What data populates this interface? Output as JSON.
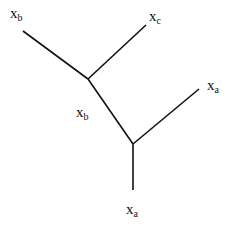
{
  "diagram": {
    "type": "unrooted-tree",
    "colors": {
      "line": "#111111",
      "background": "#ffffff"
    },
    "nodes": [
      {
        "id": "leaf-b-top",
        "x": 23,
        "y": 31
      },
      {
        "id": "leaf-c",
        "x": 146,
        "y": 25
      },
      {
        "id": "internal-1",
        "x": 88,
        "y": 79
      },
      {
        "id": "internal-2",
        "x": 133,
        "y": 144
      },
      {
        "id": "leaf-a-right",
        "x": 199,
        "y": 89
      },
      {
        "id": "leaf-a-bottom",
        "x": 133,
        "y": 190
      }
    ],
    "edges": [
      {
        "from": "leaf-b-top",
        "to": "internal-1",
        "x1": 23,
        "y1": 31,
        "x2": 88,
        "y2": 79
      },
      {
        "from": "internal-1",
        "to": "leaf-c",
        "x1": 88,
        "y1": 79,
        "x2": 146,
        "y2": 25
      },
      {
        "from": "internal-1",
        "to": "internal-2",
        "x1": 88,
        "y1": 79,
        "x2": 133,
        "y2": 144
      },
      {
        "from": "internal-2",
        "to": "leaf-a-right",
        "x1": 133,
        "y1": 144,
        "x2": 199,
        "y2": 89
      },
      {
        "from": "internal-2",
        "to": "leaf-a-bottom",
        "x1": 133,
        "y1": 144,
        "x2": 133,
        "y2": 190
      }
    ],
    "labels": [
      {
        "name": "label-xb-top",
        "base": "x",
        "sub": "b",
        "left": 10,
        "top": 6
      },
      {
        "name": "label-xc",
        "base": "x",
        "sub": "c",
        "left": 149,
        "top": 9
      },
      {
        "name": "label-xa-right",
        "base": "x",
        "sub": "a",
        "left": 207,
        "top": 78
      },
      {
        "name": "label-xb-middle",
        "base": "x",
        "sub": "b",
        "left": 76,
        "top": 105
      },
      {
        "name": "label-xa-bottom",
        "base": "x",
        "sub": "a",
        "left": 126,
        "top": 202
      }
    ]
  }
}
